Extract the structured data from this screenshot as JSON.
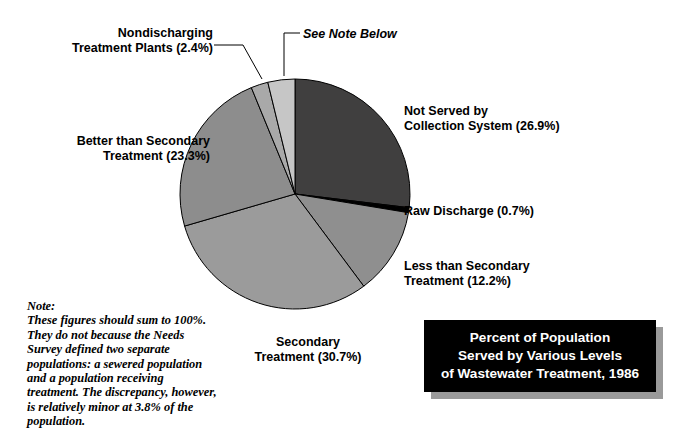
{
  "title": {
    "text": "Percent of Population\nServed by Various Levels\nof Wastewater Treatment, 1986",
    "background_color": "#000000",
    "text_color": "#ffffff",
    "shadow_color": "#9a9a9a"
  },
  "note": {
    "heading": "Note:",
    "body": "These figures should sum to 100%. They do not because the Needs Survey defined two separate populations: a sewered population and a population receiving treatment. The discrepancy, however, is relatively minor at 3.8% of the population."
  },
  "labels": {
    "nondischarging": "Nondischarging\nTreatment Plants (2.4%)",
    "see_note": "See Note Below",
    "not_served": "Not Served by\nCollection System (26.9%)",
    "raw_discharge": "Raw Discharge (0.7%)",
    "less_than_secondary": "Less than Secondary\nTreatment (12.2%)",
    "secondary": "Secondary\nTreatment (30.7%)",
    "better_than_secondary": "Better than Secondary\nTreatment (23.3%)"
  },
  "chart_data": {
    "type": "pie",
    "title": "Percent of Population Served by Various Levels of Wastewater Treatment, 1986",
    "xlabel": "",
    "ylabel": "",
    "units": "percent of population",
    "start_angle_deg": 0,
    "direction": "clockwise",
    "legend": "none (direct labels with leader lines)",
    "total_labeled": 96.2,
    "categories": [
      "Not Served by Collection System",
      "Raw Discharge",
      "Less than Secondary Treatment",
      "Secondary Treatment",
      "Better than Secondary Treatment",
      "Nondischarging Treatment Plants",
      "See Note Below"
    ],
    "values": [
      26.9,
      0.7,
      12.2,
      30.7,
      23.3,
      2.4,
      3.8
    ],
    "colors": [
      "#403f3f",
      "#000000",
      "#8f8f8f",
      "#9b9b9b",
      "#8d8d8d",
      "#a9a9a9",
      "#c6c6c6"
    ],
    "slices": [
      {
        "label": "Not Served by Collection System",
        "value": 26.9,
        "color": "#403f3f"
      },
      {
        "label": "Raw Discharge",
        "value": 0.7,
        "color": "#000000"
      },
      {
        "label": "Less than Secondary Treatment",
        "value": 12.2,
        "color": "#8f8f8f"
      },
      {
        "label": "Secondary Treatment",
        "value": 30.7,
        "color": "#9b9b9b"
      },
      {
        "label": "Better than Secondary Treatment",
        "value": 23.3,
        "color": "#8d8d8d"
      },
      {
        "label": "Nondischarging Treatment Plants",
        "value": 2.4,
        "color": "#a9a9a9"
      },
      {
        "label": "See Note Below",
        "value": 3.8,
        "color": "#c6c6c6"
      }
    ],
    "geometry": {
      "center_x": 295,
      "center_y": 194,
      "radius": 115,
      "stroke_color": "#000000",
      "stroke_width": 1
    },
    "leader_lines": [
      {
        "name": "nondischarging-leader",
        "points": "214,45 243,45 262,79"
      },
      {
        "name": "see-note-leader",
        "points": "300,33 284,33 284,76"
      }
    ]
  }
}
